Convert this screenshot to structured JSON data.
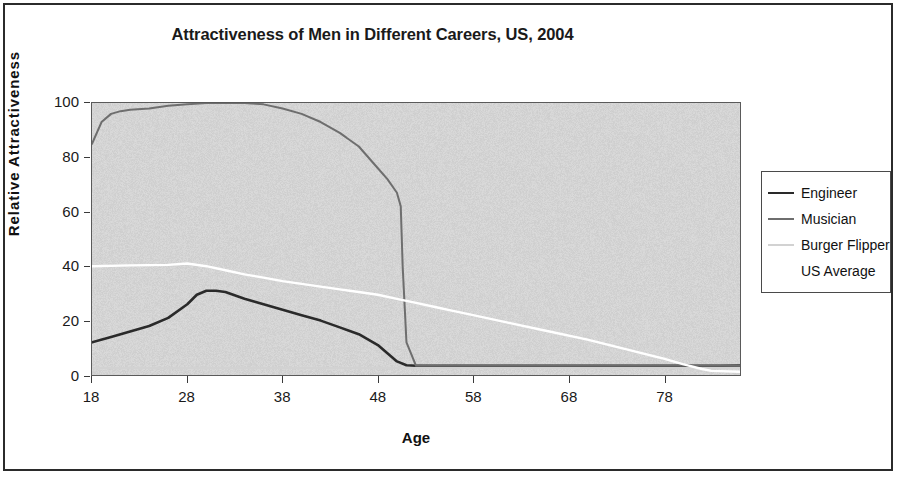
{
  "chart_data": {
    "type": "line",
    "title": "Attractiveness of Men in Different Careers, US, 2004",
    "xlabel": "Age",
    "ylabel": "Relative Attractiveness",
    "xlim": [
      18,
      86
    ],
    "ylim": [
      0,
      100
    ],
    "xticks": [
      18,
      28,
      38,
      48,
      58,
      68,
      78
    ],
    "yticks": [
      0,
      20,
      40,
      60,
      80,
      100
    ],
    "grid": false,
    "legend_position": "right",
    "plot_background": "#d2d2d2",
    "series": [
      {
        "name": "Engineer",
        "color": "#2a2a2a",
        "width": 2.6,
        "x": [
          18,
          20,
          22,
          24,
          26,
          28,
          29,
          30,
          31,
          32,
          34,
          36,
          38,
          40,
          42,
          44,
          46,
          48,
          49,
          50,
          51,
          52,
          56,
          62,
          68,
          74,
          80,
          84,
          86
        ],
        "y": [
          12,
          14,
          16,
          18,
          21,
          26,
          29.5,
          31,
          31,
          30.5,
          28,
          26,
          24,
          22,
          20,
          17.5,
          15,
          11,
          8,
          5,
          3.6,
          3.4,
          3.4,
          3.4,
          3.4,
          3.4,
          3.4,
          3.4,
          3.5
        ]
      },
      {
        "name": "Musician",
        "color": "#6e6e6e",
        "width": 2.0,
        "x": [
          18,
          19,
          20,
          21,
          22,
          24,
          26,
          28,
          30,
          32,
          34,
          36,
          38,
          40,
          42,
          44,
          46,
          48,
          49,
          50,
          50.4,
          50.6,
          51,
          52,
          58,
          66,
          74,
          82,
          86
        ],
        "y": [
          85,
          93,
          96,
          97,
          97.5,
          98,
          99,
          99.5,
          100,
          100,
          100,
          99.5,
          98,
          96,
          93,
          89,
          84,
          76,
          72,
          67,
          62,
          40,
          12,
          3.4,
          3.4,
          3.4,
          3.4,
          3.4,
          3.4
        ]
      },
      {
        "name": "Burger Flipper",
        "color": "#d2d2d2",
        "width": 2.0,
        "x": [
          18,
          86
        ],
        "y": [
          2.6,
          2.6
        ]
      },
      {
        "name": "US Average",
        "color": "#ffffff",
        "width": 2.4,
        "x": [
          18,
          22,
          26,
          28,
          30,
          32,
          34,
          36,
          38,
          40,
          42,
          44,
          46,
          48,
          50,
          52,
          54,
          56,
          58,
          62,
          66,
          70,
          74,
          78,
          80,
          82,
          83,
          86
        ],
        "y": [
          40,
          40.3,
          40.5,
          41,
          40,
          38.5,
          37,
          35.8,
          34.5,
          33.5,
          32.5,
          31.5,
          30.5,
          29.5,
          28,
          26.5,
          25,
          23.5,
          22,
          19,
          16,
          13,
          9.5,
          6,
          4,
          2.2,
          1.5,
          1.2
        ]
      }
    ]
  },
  "legend": {
    "entries": [
      {
        "label": "Engineer"
      },
      {
        "label": "Musician"
      },
      {
        "label": "Burger Flipper"
      },
      {
        "label": "US Average"
      }
    ]
  }
}
